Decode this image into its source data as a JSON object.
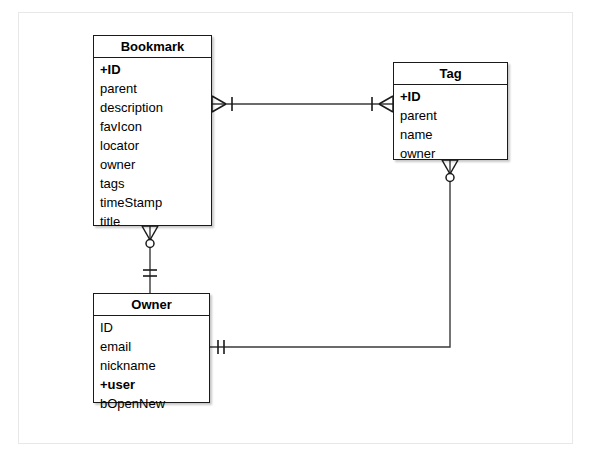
{
  "diagram": {
    "type": "entity-relationship-diagram",
    "notation": "crows-foot",
    "background_color": "#ffffff",
    "frame_border_color": "#e8e8e8",
    "entity_border_color": "#1a1a1a",
    "connector_color": "#3a3a3a",
    "entities": [
      {
        "id": "bookmark",
        "title": "Bookmark",
        "x": 93,
        "y": 35,
        "width": 119,
        "height": 191,
        "fields": [
          {
            "label": "+ID",
            "key": true
          },
          {
            "label": "parent",
            "key": false
          },
          {
            "label": "description",
            "key": false
          },
          {
            "label": "favIcon",
            "key": false
          },
          {
            "label": "locator",
            "key": false
          },
          {
            "label": "owner",
            "key": false
          },
          {
            "label": "tags",
            "key": false
          },
          {
            "label": "timeStamp",
            "key": false
          },
          {
            "label": "title",
            "key": false
          }
        ]
      },
      {
        "id": "tag",
        "title": "Tag",
        "x": 393,
        "y": 62,
        "width": 115,
        "height": 98,
        "fields": [
          {
            "label": "+ID",
            "key": true
          },
          {
            "label": "parent",
            "key": false
          },
          {
            "label": "name",
            "key": false
          },
          {
            "label": "owner",
            "key": false
          }
        ]
      },
      {
        "id": "owner",
        "title": "Owner",
        "x": 93,
        "y": 293,
        "width": 117,
        "height": 110,
        "fields": [
          {
            "label": "ID",
            "key": false
          },
          {
            "label": "email",
            "key": false
          },
          {
            "label": "nickname",
            "key": false
          },
          {
            "label": "+user",
            "key": true
          },
          {
            "label": "bOpenNew",
            "key": false
          }
        ]
      }
    ],
    "relationships": [
      {
        "id": "bookmark-tag",
        "from": "bookmark",
        "to": "tag",
        "from_cardinality": "many-one",
        "to_cardinality": "many-one",
        "label": ""
      },
      {
        "id": "bookmark-owner",
        "from": "bookmark",
        "to": "owner",
        "from_cardinality": "zero-or-many",
        "to_cardinality": "exactly-one",
        "label": ""
      },
      {
        "id": "tag-owner",
        "from": "tag",
        "to": "owner",
        "from_cardinality": "zero-or-many",
        "to_cardinality": "exactly-one",
        "label": ""
      }
    ]
  }
}
